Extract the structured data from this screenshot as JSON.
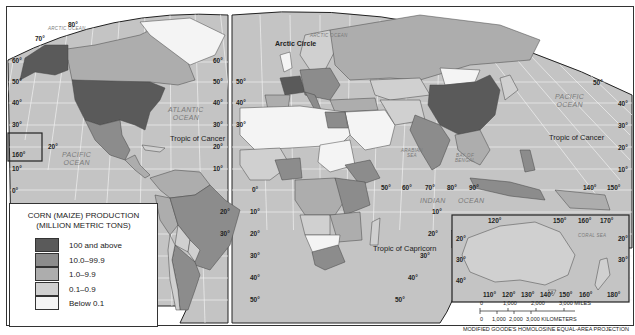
{
  "legend": {
    "title_line1": "CORN (MAIZE) PRODUCTION",
    "title_line2": "(MILLION METRIC TONS)",
    "items": [
      {
        "label": "100 and above",
        "color": "#5a5a5a"
      },
      {
        "label": "10.0–99.9",
        "color": "#8c8c8c"
      },
      {
        "label": "1.0–9.9",
        "color": "#adadad"
      },
      {
        "label": "0.1–0.9",
        "color": "#d0d0d0"
      },
      {
        "label": "Below 0.1",
        "color": "#f4f4f4"
      }
    ]
  },
  "colors": {
    "ocean": "#c4c4c4",
    "grid": "#f2f2f2",
    "border": "#333333",
    "frame_bg": "#ffffff"
  },
  "oceans": {
    "arctic_west": "ARCTIC OCEAN",
    "arctic_east": "ARCTIC OCEAN",
    "atlantic_line1": "ATLANTIC",
    "atlantic_line2": "OCEAN",
    "pacific_west_line1": "PACIFIC",
    "pacific_west_line2": "OCEAN",
    "pacific_east_line1": "PACIFIC",
    "pacific_east_line2": "OCEAN",
    "indian_line1": "INDIAN",
    "indian_line2": "OCEAN",
    "arabian_sea_line1": "ARABIAN",
    "arabian_sea_line2": "SEA",
    "bay_of_bengal_line1": "BAY OF",
    "bay_of_bengal_line2": "BENGAL",
    "coral_sea": "CORAL    SEA"
  },
  "annotations": {
    "arctic_circle": "Arctic Circle",
    "tropic_cancer_west": "Tropic of Cancer",
    "tropic_cancer_east": "Tropic of Cancer",
    "tropic_capricorn": "Tropic of Capricorn"
  },
  "gridlabels": {
    "lat_80": "80°",
    "lat_70": "70°",
    "lat_60": "60°",
    "lat_50": "50°",
    "lat_40": "40°",
    "lat_30": "30°",
    "lat_20": "20°",
    "lat_10": "10°",
    "lat_0": "0°",
    "lon_160": "160°",
    "lon_0": "0°",
    "lon_50": "50°",
    "lon_60": "60°",
    "lon_70": "70°",
    "lon_80": "80°",
    "lon_90": "90°",
    "lon_140": "140°",
    "lon_150": "150°",
    "lon_110": "110°",
    "lon_120": "120°",
    "lon_130": "130°",
    "lon_160b": "160°",
    "lon_170": "170°",
    "lon_180": "180°"
  },
  "scale": {
    "miles_ticks": [
      "0",
      "1,000",
      "2,000",
      "3,000 MILES"
    ],
    "km_ticks": [
      "0",
      "1,000",
      "2,000",
      "3,000 KILOMETERS"
    ]
  },
  "projection": "MODIFIED GOODE'S HOMOLOSINE EQUAL-AREA PROJECTION"
}
